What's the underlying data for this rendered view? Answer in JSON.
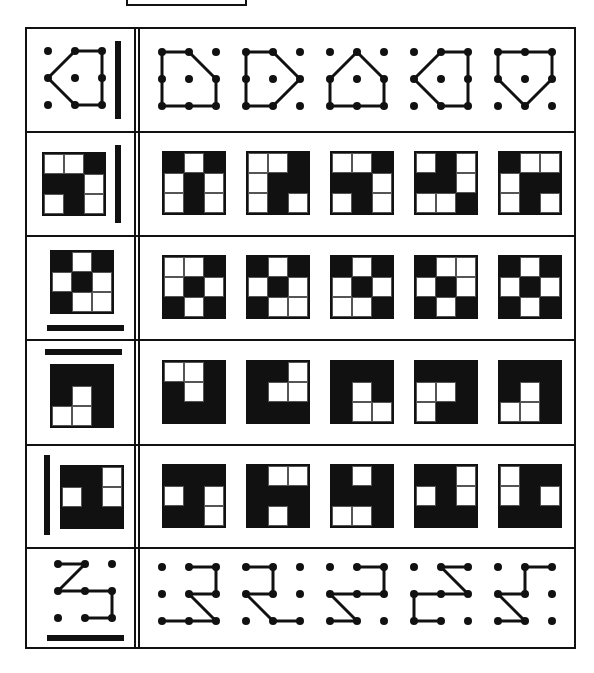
{
  "title_box": "",
  "colors": {
    "ink": "#111111",
    "paper": "#ffffff"
  },
  "layout": {
    "row_bounds": [
      [
        27,
        131
      ],
      [
        131,
        235
      ],
      [
        235,
        339
      ],
      [
        339,
        444
      ],
      [
        444,
        547
      ],
      [
        547,
        649
      ]
    ],
    "answer_x": [
      160,
      244,
      328,
      412,
      496
    ]
  },
  "rows": [
    {
      "type": "dots",
      "mirror": "vertical-right",
      "question": {
        "edges": [
          [
            [
              1,
              0
            ],
            [
              2,
              0
            ]
          ],
          [
            [
              2,
              0
            ],
            [
              2,
              1
            ]
          ],
          [
            [
              2,
              1
            ],
            [
              2,
              2
            ]
          ],
          [
            [
              2,
              2
            ],
            [
              1,
              2
            ]
          ],
          [
            [
              1,
              2
            ],
            [
              0,
              1
            ]
          ],
          [
            [
              0,
              1
            ],
            [
              1,
              0
            ]
          ]
        ]
      },
      "options": [
        {
          "edges": [
            [
              [
                0,
                0
              ],
              [
                1,
                0
              ]
            ],
            [
              [
                1,
                0
              ],
              [
                2,
                1
              ]
            ],
            [
              [
                2,
                1
              ],
              [
                2,
                2
              ]
            ],
            [
              [
                2,
                2
              ],
              [
                1,
                2
              ]
            ],
            [
              [
                1,
                2
              ],
              [
                0,
                2
              ]
            ],
            [
              [
                0,
                2
              ],
              [
                0,
                1
              ]
            ],
            [
              [
                0,
                1
              ],
              [
                0,
                0
              ]
            ]
          ]
        },
        {
          "edges": [
            [
              [
                0,
                0
              ],
              [
                1,
                0
              ]
            ],
            [
              [
                1,
                0
              ],
              [
                2,
                1
              ]
            ],
            [
              [
                2,
                1
              ],
              [
                1,
                2
              ]
            ],
            [
              [
                1,
                2
              ],
              [
                0,
                2
              ]
            ],
            [
              [
                0,
                2
              ],
              [
                0,
                1
              ]
            ],
            [
              [
                0,
                1
              ],
              [
                0,
                0
              ]
            ]
          ]
        },
        {
          "edges": [
            [
              [
                1,
                0
              ],
              [
                2,
                1
              ]
            ],
            [
              [
                2,
                1
              ],
              [
                2,
                2
              ]
            ],
            [
              [
                2,
                2
              ],
              [
                1,
                2
              ]
            ],
            [
              [
                1,
                2
              ],
              [
                0,
                2
              ]
            ],
            [
              [
                0,
                2
              ],
              [
                0,
                1
              ]
            ],
            [
              [
                0,
                1
              ],
              [
                1,
                0
              ]
            ]
          ]
        },
        {
          "edges": [
            [
              [
                1,
                0
              ],
              [
                2,
                0
              ]
            ],
            [
              [
                2,
                0
              ],
              [
                2,
                1
              ]
            ],
            [
              [
                2,
                1
              ],
              [
                2,
                2
              ]
            ],
            [
              [
                2,
                2
              ],
              [
                1,
                2
              ]
            ],
            [
              [
                1,
                2
              ],
              [
                0,
                1
              ]
            ],
            [
              [
                0,
                1
              ],
              [
                1,
                0
              ]
            ]
          ]
        },
        {
          "edges": [
            [
              [
                0,
                0
              ],
              [
                1,
                0
              ]
            ],
            [
              [
                1,
                0
              ],
              [
                2,
                0
              ]
            ],
            [
              [
                2,
                0
              ],
              [
                2,
                1
              ]
            ],
            [
              [
                2,
                1
              ],
              [
                1,
                2
              ]
            ],
            [
              [
                1,
                2
              ],
              [
                0,
                1
              ]
            ],
            [
              [
                0,
                1
              ],
              [
                0,
                0
              ]
            ]
          ]
        }
      ]
    },
    {
      "type": "grid",
      "mirror": "vertical-right",
      "question": [
        [
          "W",
          "W",
          "B"
        ],
        [
          "B",
          "B",
          "W"
        ],
        [
          "W",
          "B",
          "W"
        ]
      ],
      "options": [
        [
          [
            "B",
            "W",
            "B"
          ],
          [
            "W",
            "B",
            "W"
          ],
          [
            "W",
            "B",
            "W"
          ]
        ],
        [
          [
            "W",
            "W",
            "B"
          ],
          [
            "W",
            "B",
            "B"
          ],
          [
            "W",
            "B",
            "W"
          ]
        ],
        [
          [
            "W",
            "W",
            "B"
          ],
          [
            "B",
            "B",
            "W"
          ],
          [
            "W",
            "B",
            "W"
          ]
        ],
        [
          [
            "W",
            "B",
            "W"
          ],
          [
            "B",
            "B",
            "W"
          ],
          [
            "W",
            "W",
            "B"
          ]
        ],
        [
          [
            "B",
            "W",
            "W"
          ],
          [
            "W",
            "B",
            "B"
          ],
          [
            "W",
            "B",
            "W"
          ]
        ]
      ]
    },
    {
      "type": "grid",
      "mirror": "horizontal-bottom",
      "question": [
        [
          "B",
          "W",
          "B"
        ],
        [
          "W",
          "B",
          "W"
        ],
        [
          "B",
          "W",
          "W"
        ]
      ],
      "options": [
        [
          [
            "W",
            "W",
            "B"
          ],
          [
            "W",
            "B",
            "W"
          ],
          [
            "B",
            "W",
            "B"
          ]
        ],
        [
          [
            "B",
            "W",
            "B"
          ],
          [
            "W",
            "B",
            "W"
          ],
          [
            "B",
            "W",
            "W"
          ]
        ],
        [
          [
            "B",
            "W",
            "B"
          ],
          [
            "W",
            "B",
            "W"
          ],
          [
            "W",
            "W",
            "B"
          ]
        ],
        [
          [
            "B",
            "W",
            "W"
          ],
          [
            "W",
            "B",
            "W"
          ],
          [
            "B",
            "W",
            "B"
          ]
        ],
        [
          [
            "B",
            "W",
            "B"
          ],
          [
            "W",
            "B",
            "W"
          ],
          [
            "B",
            "W",
            "B"
          ]
        ]
      ]
    },
    {
      "type": "grid",
      "mirror": "horizontal-top",
      "question": [
        [
          "B",
          "B",
          "B"
        ],
        [
          "B",
          "W",
          "B"
        ],
        [
          "W",
          "W",
          "B"
        ]
      ],
      "options": [
        [
          [
            "W",
            "W",
            "B"
          ],
          [
            "B",
            "W",
            "B"
          ],
          [
            "B",
            "B",
            "B"
          ]
        ],
        [
          [
            "B",
            "B",
            "W"
          ],
          [
            "B",
            "W",
            "W"
          ],
          [
            "B",
            "B",
            "B"
          ]
        ],
        [
          [
            "B",
            "B",
            "B"
          ],
          [
            "B",
            "W",
            "B"
          ],
          [
            "B",
            "W",
            "W"
          ]
        ],
        [
          [
            "B",
            "B",
            "B"
          ],
          [
            "W",
            "W",
            "B"
          ],
          [
            "W",
            "B",
            "B"
          ]
        ],
        [
          [
            "B",
            "B",
            "B"
          ],
          [
            "B",
            "W",
            "B"
          ],
          [
            "W",
            "W",
            "B"
          ]
        ]
      ]
    },
    {
      "type": "grid",
      "mirror": "vertical-left",
      "question": [
        [
          "B",
          "B",
          "W"
        ],
        [
          "W",
          "B",
          "W"
        ],
        [
          "B",
          "B",
          "B"
        ]
      ],
      "options": [
        [
          [
            "B",
            "B",
            "B"
          ],
          [
            "W",
            "B",
            "W"
          ],
          [
            "B",
            "B",
            "W"
          ]
        ],
        [
          [
            "B",
            "W",
            "W"
          ],
          [
            "B",
            "B",
            "B"
          ],
          [
            "B",
            "W",
            "B"
          ]
        ],
        [
          [
            "B",
            "W",
            "B"
          ],
          [
            "B",
            "B",
            "B"
          ],
          [
            "W",
            "W",
            "B"
          ]
        ],
        [
          [
            "B",
            "B",
            "W"
          ],
          [
            "W",
            "B",
            "W"
          ],
          [
            "B",
            "B",
            "B"
          ]
        ],
        [
          [
            "W",
            "B",
            "B"
          ],
          [
            "W",
            "B",
            "W"
          ],
          [
            "B",
            "B",
            "B"
          ]
        ]
      ]
    },
    {
      "type": "dots",
      "mirror": "horizontal-bottom",
      "question": {
        "edges": [
          [
            [
              0,
              0
            ],
            [
              1,
              0
            ]
          ],
          [
            [
              1,
              0
            ],
            [
              0,
              1
            ]
          ],
          [
            [
              0,
              1
            ],
            [
              1,
              1
            ]
          ],
          [
            [
              1,
              1
            ],
            [
              2,
              1
            ]
          ],
          [
            [
              2,
              1
            ],
            [
              2,
              2
            ]
          ],
          [
            [
              2,
              2
            ],
            [
              1,
              2
            ]
          ]
        ]
      },
      "options": [
        {
          "edges": [
            [
              [
                1,
                0
              ],
              [
                2,
                0
              ]
            ],
            [
              [
                2,
                0
              ],
              [
                2,
                1
              ]
            ],
            [
              [
                2,
                1
              ],
              [
                1,
                1
              ]
            ],
            [
              [
                1,
                1
              ],
              [
                2,
                2
              ]
            ],
            [
              [
                2,
                2
              ],
              [
                1,
                2
              ]
            ],
            [
              [
                1,
                2
              ],
              [
                0,
                2
              ]
            ]
          ]
        },
        {
          "edges": [
            [
              [
                0,
                0
              ],
              [
                1,
                0
              ]
            ],
            [
              [
                1,
                0
              ],
              [
                1,
                1
              ]
            ],
            [
              [
                1,
                1
              ],
              [
                0,
                1
              ]
            ],
            [
              [
                0,
                1
              ],
              [
                1,
                2
              ]
            ],
            [
              [
                1,
                2
              ],
              [
                2,
                2
              ]
            ]
          ]
        },
        {
          "edges": [
            [
              [
                1,
                0
              ],
              [
                2,
                0
              ]
            ],
            [
              [
                2,
                0
              ],
              [
                2,
                1
              ]
            ],
            [
              [
                2,
                1
              ],
              [
                1,
                1
              ]
            ],
            [
              [
                1,
                1
              ],
              [
                0,
                1
              ]
            ],
            [
              [
                0,
                1
              ],
              [
                1,
                2
              ]
            ],
            [
              [
                1,
                2
              ],
              [
                0,
                2
              ]
            ]
          ]
        },
        {
          "edges": [
            [
              [
                1,
                0
              ],
              [
                2,
                0
              ]
            ],
            [
              [
                1,
                0
              ],
              [
                2,
                1
              ]
            ],
            [
              [
                2,
                1
              ],
              [
                1,
                1
              ]
            ],
            [
              [
                1,
                1
              ],
              [
                0,
                1
              ]
            ],
            [
              [
                0,
                1
              ],
              [
                0,
                2
              ]
            ],
            [
              [
                0,
                2
              ],
              [
                1,
                2
              ]
            ]
          ]
        },
        {
          "edges": [
            [
              [
                1,
                0
              ],
              [
                2,
                0
              ]
            ],
            [
              [
                1,
                0
              ],
              [
                1,
                1
              ]
            ],
            [
              [
                1,
                1
              ],
              [
                0,
                1
              ]
            ],
            [
              [
                0,
                1
              ],
              [
                1,
                2
              ]
            ],
            [
              [
                1,
                2
              ],
              [
                0,
                2
              ]
            ]
          ]
        }
      ]
    }
  ]
}
